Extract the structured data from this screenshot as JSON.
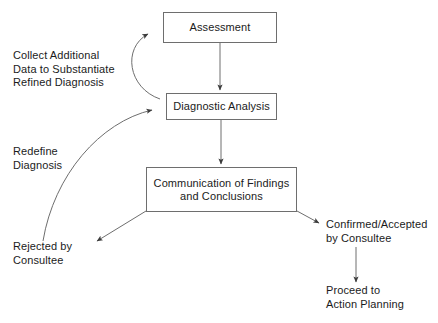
{
  "diagram": {
    "stroke_color": "#6e6e6e",
    "text_color": "#1b1b1b",
    "background_color": "#ffffff",
    "nodes": [
      {
        "id": "assessment",
        "label": "Assessment"
      },
      {
        "id": "diagnostic",
        "label": "Diagnostic Analysis"
      },
      {
        "id": "communication",
        "label": "Communication of Findings\nand Conclusions"
      }
    ],
    "captions": [
      {
        "id": "collect",
        "label": "Collect Additional\nData to Substantiate\nRefined Diagnosis"
      },
      {
        "id": "redefine",
        "label": "Redefine\nDiagnosis"
      },
      {
        "id": "rejected",
        "label": "Rejected by\nConsultee"
      },
      {
        "id": "confirmed",
        "label": "Confirmed/Accepted\nby Consultee"
      },
      {
        "id": "proceed",
        "label": "Proceed to\nAction Planning"
      }
    ],
    "edges": [
      {
        "id": "assessment-to-diagnostic",
        "from": "assessment",
        "to": "diagnostic",
        "style": "straight-down"
      },
      {
        "id": "diagnostic-to-communication",
        "from": "diagnostic",
        "to": "communication",
        "style": "straight-down"
      },
      {
        "id": "diagnostic-to-assessment",
        "from": "diagnostic",
        "to": "assessment",
        "style": "curved-left-up"
      },
      {
        "id": "rejected-to-diagnostic",
        "from": "rejected",
        "to": "diagnostic",
        "style": "curved-long-left"
      },
      {
        "id": "communication-to-rejected",
        "from": "communication",
        "to": "rejected",
        "style": "diagonal-down-left"
      },
      {
        "id": "communication-to-confirmed",
        "from": "communication",
        "to": "confirmed",
        "style": "diagonal-down-right"
      },
      {
        "id": "confirmed-to-proceed",
        "from": "confirmed",
        "to": "proceed",
        "style": "straight-down"
      }
    ]
  }
}
